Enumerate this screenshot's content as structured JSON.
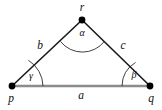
{
  "figure": {
    "kind": "geometry-triangle-diagram",
    "background_color": "#ffffff",
    "side_color": "#1a1a1a",
    "base_color": "#8c8c8c",
    "arc_color": "#2b2b2b",
    "vertex_color": "#000000",
    "label_color": "#111111"
  },
  "vertices": {
    "p": {
      "label": "p",
      "x": 12,
      "y": 86,
      "label_x": 11,
      "label_y": 99
    },
    "q": {
      "label": "q",
      "x": 150,
      "y": 86,
      "label_x": 151,
      "label_y": 99
    },
    "r": {
      "label": "r",
      "x": 82,
      "y": 20,
      "label_x": 82,
      "label_y": 8
    }
  },
  "sides": {
    "a": {
      "label": "a",
      "from": "p",
      "to": "q",
      "label_x": 81,
      "label_y": 96
    },
    "b": {
      "label": "b",
      "from": "p",
      "to": "r",
      "label_x": 40,
      "label_y": 46
    },
    "c": {
      "label": "c",
      "from": "r",
      "to": "q",
      "label_x": 123,
      "label_y": 46
    }
  },
  "angles": {
    "alpha": {
      "label": "α",
      "at_vertex": "r",
      "label_x": 82,
      "label_y": 34
    },
    "beta": {
      "label": "β",
      "at_vertex": "q",
      "label_x": 134,
      "label_y": 76
    },
    "gamma": {
      "label": "γ",
      "at_vertex": "p",
      "label_x": 31,
      "label_y": 77
    }
  }
}
